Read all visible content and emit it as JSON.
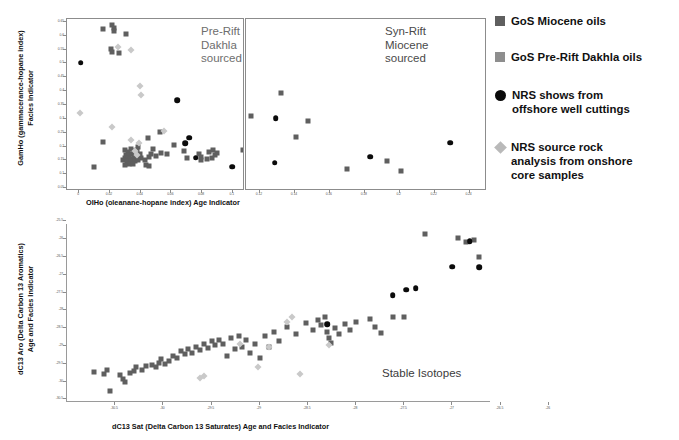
{
  "figure": {
    "legend": {
      "items": [
        {
          "marker": "square-dark-icon",
          "label": "GoS Miocene oils"
        },
        {
          "marker": "square-light-icon",
          "label": "GoS Pre-Rift Dakhla oils"
        },
        {
          "marker": "circle-black-icon",
          "label": "NRS shows from\noffshore well cuttings"
        },
        {
          "marker": "diamond-light-icon",
          "label": "NRS source rock\nanalysis from onshore\ncore samples"
        }
      ]
    },
    "colors": {
      "gos_miocene": "#5f5f5f",
      "gos_prerift_dakhla": "#9a9a9a",
      "nrs_shows": "#0b0b0b",
      "nrs_source_rock": "#c9c9c9",
      "panel_border": "#8c8c8c",
      "annotation_text": "#6e6e6e"
    },
    "annotations": {
      "left_panel": "Pre-Rift\nDakhla\nsourced",
      "right_panel": "Syn-Rift\nMiocene\nsourced",
      "stable_isotopes": "Stable Isotopes"
    }
  },
  "chart_data": [
    {
      "id": "olho-gamho",
      "type": "scatter",
      "title": "",
      "xlabel": "OIHo (oleanane-hopane index) Age Indicator",
      "ylabel": "GamHo (gammacerance-hopane index)\nFacies Indicator",
      "xlim": [
        -0.008,
        0.25
      ],
      "ylim": [
        0.04,
        0.66
      ],
      "grid": false,
      "legend_position": "right-outside",
      "xticks": [
        "0",
        "0.02",
        "0.04",
        "0.06",
        "0.08",
        "0.1",
        "0.12",
        "0.14",
        "0.16",
        "0.18",
        "0.2",
        "0.22",
        "0.24"
      ],
      "xtick_values": [
        0,
        0.02,
        0.04,
        0.06,
        0.08,
        0.1,
        0.12,
        0.14,
        0.16,
        0.18,
        0.2,
        0.22,
        0.24
      ],
      "yticks": [
        "0.05",
        "0.1",
        "0.15",
        "0.2",
        "0.25",
        "0.3",
        "0.35",
        "0.4",
        "0.45",
        "0.5",
        "0.55",
        "0.6",
        "0.65"
      ],
      "ytick_values": [
        0.05,
        0.1,
        0.15,
        0.2,
        0.25,
        0.3,
        0.35,
        0.4,
        0.45,
        0.5,
        0.55,
        0.6,
        0.65
      ],
      "panels": [
        {
          "name": "pre-rift-dakhla-sourced",
          "x_range": [
            -0.008,
            0.108
          ]
        },
        {
          "name": "syn-rift-miocene-sourced",
          "x_range": [
            0.112,
            0.25
          ]
        }
      ],
      "series": [
        {
          "name": "GoS Miocene oils",
          "marker": "square-dark",
          "points": [
            [
              0.0155,
              0.625
            ],
            [
              0.0215,
              0.637
            ],
            [
              0.0225,
              0.627
            ],
            [
              0.0225,
              0.615
            ],
            [
              0.0305,
              0.607
            ],
            [
              0.0205,
              0.553
            ],
            [
              0.021,
              0.542
            ],
            [
              0.026,
              0.539
            ],
            [
              0.0155,
              0.215
            ],
            [
              0.0445,
              0.232
            ],
            [
              0.0525,
              0.252
            ],
            [
              0.0385,
              0.197
            ],
            [
              0.03,
              0.189
            ],
            [
              0.034,
              0.19
            ],
            [
              0.0355,
              0.185
            ],
            [
              0.032,
              0.179
            ],
            [
              0.0305,
              0.168
            ],
            [
              0.0325,
              0.17
            ],
            [
              0.0345,
              0.172
            ],
            [
              0.03,
              0.16
            ],
            [
              0.0315,
              0.158
            ],
            [
              0.033,
              0.156
            ],
            [
              0.0355,
              0.162
            ],
            [
              0.0375,
              0.186
            ],
            [
              0.038,
              0.167
            ],
            [
              0.0395,
              0.173
            ],
            [
              0.0405,
              0.16
            ],
            [
              0.0285,
              0.15
            ],
            [
              0.031,
              0.148
            ],
            [
              0.0335,
              0.147
            ],
            [
              0.036,
              0.149
            ],
            [
              0.0385,
              0.152
            ],
            [
              0.0325,
              0.139
            ],
            [
              0.035,
              0.138
            ],
            [
              0.03,
              0.135
            ],
            [
              0.043,
              0.153
            ],
            [
              0.0455,
              0.162
            ],
            [
              0.047,
              0.175
            ],
            [
              0.048,
              0.192
            ],
            [
              0.05,
              0.167
            ],
            [
              0.053,
              0.177
            ],
            [
              0.057,
              0.175
            ],
            [
              0.0095,
              0.128
            ],
            [
              0.0435,
              0.134
            ],
            [
              0.0455,
              0.131
            ],
            [
              0.062,
              0.207
            ],
            [
              0.0685,
              0.183
            ],
            [
              0.07,
              0.16
            ],
            [
              0.078,
              0.172
            ],
            [
              0.0795,
              0.163
            ],
            [
              0.0845,
              0.18
            ],
            [
              0.087,
              0.186
            ],
            [
              0.0885,
              0.168
            ],
            [
              0.0895,
              0.178
            ],
            [
              0.0865,
              0.158
            ],
            [
              0.083,
              0.155
            ],
            [
              0.0795,
              0.15
            ],
            [
              0.1065,
              0.186
            ],
            [
              0.115,
              0.31
            ],
            [
              0.1405,
              0.235
            ],
            [
              0.132,
              0.392
            ],
            [
              0.1475,
              0.292
            ],
            [
              0.17,
              0.12
            ],
            [
              0.1925,
              0.148
            ],
            [
              0.2005,
              0.112
            ]
          ]
        },
        {
          "name": "NRS shows from offshore well cuttings",
          "marker": "circle-black",
          "points": [
            [
              0.001,
              0.503
            ],
            [
              0.064,
              0.368
            ],
            [
              0.0715,
              0.232
            ],
            [
              0.069,
              0.212
            ],
            [
              0.076,
              0.16
            ],
            [
              0.0995,
              0.128
            ],
            [
              0.129,
              0.302
            ],
            [
              0.1285,
              0.142
            ],
            [
              0.183,
              0.164
            ],
            [
              0.229,
              0.214
            ]
          ]
        },
        {
          "name": "NRS source rock analysis from onshore core samples",
          "marker": "diamond-light",
          "points": [
            [
              0.025,
              0.56
            ],
            [
              0.0335,
              0.55
            ],
            [
              0.0005,
              0.32
            ],
            [
              0.0395,
              0.418
            ],
            [
              0.0405,
              0.385
            ],
            [
              0.0215,
              0.272
            ],
            [
              0.0555,
              0.258
            ],
            [
              0.034,
              0.225
            ],
            [
              0.039,
              0.213
            ],
            [
              0.036,
              0.185
            ],
            [
              0.0375,
              0.17
            ]
          ]
        }
      ]
    },
    {
      "id": "dc13sat-dc13aro",
      "type": "scatter",
      "title": "Stable Isotopes",
      "xlabel": "dC13 Sat (Delta Carbon 13 Saturates) Age and Facies Indicator",
      "ylabel": "dC13 Aro (Delta Carbon 13 Aromatics)\nAge and Facies Indicator",
      "xlim": [
        -31.0,
        -26.6
      ],
      "ylim": [
        -30.6,
        -25.6
      ],
      "grid": false,
      "legend_position": "right-outside",
      "xticks": [
        "-30.5",
        "-30",
        "-29.5",
        "-29",
        "-28.5",
        "-28",
        "-27.5",
        "-27",
        "-26.5",
        "-26"
      ],
      "xtick_values": [
        -30.5,
        -30,
        -29.5,
        -29,
        -28.5,
        -28,
        -27.5,
        -27,
        -26.5,
        -26
      ],
      "yticks": [
        "-25",
        "-25.5",
        "-26",
        "-26.5",
        "-27",
        "-27.5",
        "-28",
        "-28.5",
        "-29",
        "-29.5",
        "-30",
        "-30.5"
      ],
      "ytick_values": [
        -25,
        -25.5,
        -26,
        -26.5,
        -27,
        -27.5,
        -28,
        -28.5,
        -29,
        -29.5,
        -30,
        -30.5
      ],
      "series": [
        {
          "name": "GoS Miocene oils",
          "marker": "square-dark",
          "points": [
            [
              -30.72,
              -29.75
            ],
            [
              -30.62,
              -29.8
            ],
            [
              -30.58,
              -29.7
            ],
            [
              -30.55,
              -30.3
            ],
            [
              -30.45,
              -29.85
            ],
            [
              -30.42,
              -29.95
            ],
            [
              -30.4,
              -30.05
            ],
            [
              -30.35,
              -29.78
            ],
            [
              -30.3,
              -29.72
            ],
            [
              -30.28,
              -29.62
            ],
            [
              -30.22,
              -29.7
            ],
            [
              -30.18,
              -29.58
            ],
            [
              -30.12,
              -29.55
            ],
            [
              -30.08,
              -29.62
            ],
            [
              -30.05,
              -29.5
            ],
            [
              -30.02,
              -29.4
            ],
            [
              -29.98,
              -29.52
            ],
            [
              -29.94,
              -29.45
            ],
            [
              -29.9,
              -29.3
            ],
            [
              -29.86,
              -29.36
            ],
            [
              -29.82,
              -29.18
            ],
            [
              -29.78,
              -29.25
            ],
            [
              -29.74,
              -29.12
            ],
            [
              -29.7,
              -29.22
            ],
            [
              -29.66,
              -29.05
            ],
            [
              -29.62,
              -29.15
            ],
            [
              -29.58,
              -28.98
            ],
            [
              -29.54,
              -29.08
            ],
            [
              -29.5,
              -28.9
            ],
            [
              -29.46,
              -29.0
            ],
            [
              -29.42,
              -28.86
            ],
            [
              -29.38,
              -28.96
            ],
            [
              -29.34,
              -29.3
            ],
            [
              -29.3,
              -28.8
            ],
            [
              -29.26,
              -29.12
            ],
            [
              -29.22,
              -28.74
            ],
            [
              -29.18,
              -29.05
            ],
            [
              -29.14,
              -28.86
            ],
            [
              -29.1,
              -29.22
            ],
            [
              -29.05,
              -28.96
            ],
            [
              -29.0,
              -29.35
            ],
            [
              -28.95,
              -28.74
            ],
            [
              -28.9,
              -29.05
            ],
            [
              -28.85,
              -28.62
            ],
            [
              -28.8,
              -28.88
            ],
            [
              -28.72,
              -28.5
            ],
            [
              -28.62,
              -28.7
            ],
            [
              -28.52,
              -28.38
            ],
            [
              -28.45,
              -28.58
            ],
            [
              -28.4,
              -28.3
            ],
            [
              -28.36,
              -28.44
            ],
            [
              -28.32,
              -28.22
            ],
            [
              -28.3,
              -28.62
            ],
            [
              -28.28,
              -28.8
            ],
            [
              -28.26,
              -28.95
            ],
            [
              -28.22,
              -28.52
            ],
            [
              -28.18,
              -28.7
            ],
            [
              -28.12,
              -28.4
            ],
            [
              -28.06,
              -28.58
            ],
            [
              -28.0,
              -28.34
            ],
            [
              -27.86,
              -28.28
            ],
            [
              -27.8,
              -28.48
            ],
            [
              -27.74,
              -28.66
            ],
            [
              -27.62,
              -28.22
            ],
            [
              -27.5,
              -28.2
            ],
            [
              -27.28,
              -25.88
            ],
            [
              -26.94,
              -26.0
            ],
            [
              -26.86,
              -26.1
            ],
            [
              -26.78,
              -26.05
            ],
            [
              -26.72,
              -26.52
            ]
          ]
        },
        {
          "name": "NRS shows from offshore well cuttings",
          "marker": "circle-black",
          "points": [
            [
              -28.3,
              -28.42
            ],
            [
              -27.62,
              -27.6
            ],
            [
              -27.48,
              -27.45
            ],
            [
              -27.38,
              -27.4
            ],
            [
              -27.0,
              -26.8
            ],
            [
              -26.82,
              -26.08
            ],
            [
              -26.72,
              -26.82
            ]
          ]
        },
        {
          "name": "NRS source rock analysis from onshore core samples",
          "marker": "diamond-light",
          "points": [
            [
              -29.62,
              -29.92
            ],
            [
              -29.58,
              -29.86
            ],
            [
              -28.72,
              -28.36
            ],
            [
              -28.66,
              -28.22
            ],
            [
              -29.2,
              -28.98
            ],
            [
              -28.9,
              -29.05
            ],
            [
              -28.28,
              -29.0
            ],
            [
              -29.02,
              -29.62
            ],
            [
              -28.58,
              -29.8
            ]
          ]
        }
      ]
    }
  ]
}
